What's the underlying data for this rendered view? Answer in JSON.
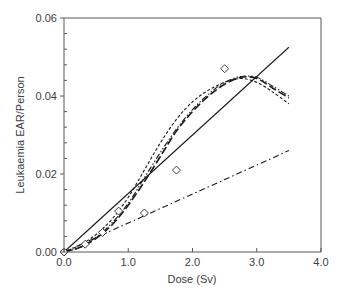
{
  "chart_data": {
    "type": "line",
    "title": "",
    "xlabel": "Dose (Sv)",
    "ylabel": "Leukaemia EAR/Person",
    "xlim": [
      0,
      4.0
    ],
    "ylim": [
      0,
      0.06
    ],
    "x_ticks": [
      "0.0",
      "1.0",
      "2.0",
      "3.0",
      "4.0"
    ],
    "y_ticks": [
      "0.00",
      "0.02",
      "0.04",
      "0.06"
    ],
    "grid": false,
    "legend": null,
    "series": [
      {
        "name": "Observed data",
        "style": "markers-diamond-open",
        "points": [
          [
            0.0,
            0.0
          ],
          [
            0.33,
            0.002
          ],
          [
            0.6,
            0.005
          ],
          [
            0.85,
            0.0105
          ],
          [
            1.25,
            0.01
          ],
          [
            1.75,
            0.021
          ],
          [
            2.5,
            0.047
          ]
        ]
      },
      {
        "name": "Linear model",
        "style": "solid",
        "points": [
          [
            0.0,
            0.0
          ],
          [
            3.5,
            0.0525
          ]
        ]
      },
      {
        "name": "Linear model (low)",
        "style": "dash-dot",
        "points": [
          [
            0.0,
            0.0
          ],
          [
            3.5,
            0.026
          ]
        ]
      },
      {
        "name": "Curve short-dash",
        "style": "short-dash",
        "points": [
          [
            0.0,
            0.0
          ],
          [
            0.25,
            0.0018
          ],
          [
            0.5,
            0.0045
          ],
          [
            0.75,
            0.0085
          ],
          [
            1.0,
            0.014
          ],
          [
            1.25,
            0.021
          ],
          [
            1.5,
            0.028
          ],
          [
            1.75,
            0.034
          ],
          [
            2.0,
            0.0385
          ],
          [
            2.25,
            0.0415
          ],
          [
            2.5,
            0.0435
          ],
          [
            2.75,
            0.0445
          ],
          [
            3.0,
            0.0435
          ],
          [
            3.25,
            0.041
          ],
          [
            3.5,
            0.038
          ]
        ]
      },
      {
        "name": "Curve long-dash",
        "style": "long-dash",
        "points": [
          [
            0.0,
            0.0
          ],
          [
            0.25,
            0.0012
          ],
          [
            0.5,
            0.0035
          ],
          [
            0.75,
            0.007
          ],
          [
            1.0,
            0.012
          ],
          [
            1.25,
            0.018
          ],
          [
            1.5,
            0.0245
          ],
          [
            1.75,
            0.031
          ],
          [
            2.0,
            0.036
          ],
          [
            2.25,
            0.04
          ],
          [
            2.5,
            0.043
          ],
          [
            2.75,
            0.0448
          ],
          [
            3.0,
            0.0445
          ],
          [
            3.25,
            0.042
          ],
          [
            3.5,
            0.0395
          ]
        ]
      },
      {
        "name": "Curve dash-dot-dot",
        "style": "dash-dot-dot",
        "points": [
          [
            0.0,
            0.0
          ],
          [
            0.25,
            0.0012
          ],
          [
            0.5,
            0.0038
          ],
          [
            0.75,
            0.0075
          ],
          [
            1.0,
            0.0125
          ],
          [
            1.25,
            0.019
          ],
          [
            1.5,
            0.0255
          ],
          [
            1.75,
            0.0315
          ],
          [
            2.0,
            0.0365
          ],
          [
            2.25,
            0.0405
          ],
          [
            2.5,
            0.0435
          ],
          [
            2.75,
            0.045
          ],
          [
            3.0,
            0.0448
          ],
          [
            3.25,
            0.0425
          ],
          [
            3.5,
            0.04
          ]
        ]
      }
    ]
  }
}
